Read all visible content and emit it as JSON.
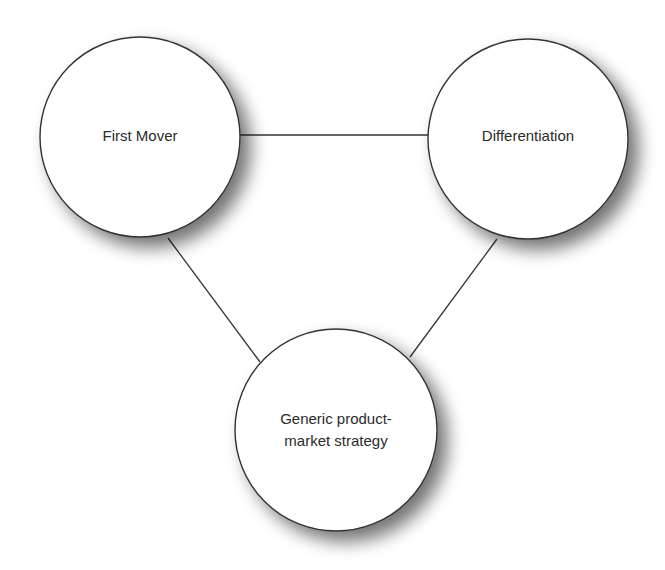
{
  "diagram": {
    "type": "triangle-relationship",
    "nodes": [
      {
        "id": "first-mover",
        "label_lines": [
          "First Mover"
        ],
        "cx": 140,
        "cy": 137,
        "r": 100
      },
      {
        "id": "differentiation",
        "label_lines": [
          "Differentiation"
        ],
        "cx": 528,
        "cy": 139,
        "r": 100
      },
      {
        "id": "generic-strategy",
        "label_lines": [
          "Generic product-",
          "market strategy"
        ],
        "cx": 336,
        "cy": 430,
        "r": 101
      }
    ],
    "edges": [
      {
        "from": "first-mover",
        "to": "differentiation"
      },
      {
        "from": "first-mover",
        "to": "generic-strategy"
      },
      {
        "from": "differentiation",
        "to": "generic-strategy"
      }
    ],
    "colors": {
      "stroke": "#333333",
      "fill": "#ffffff",
      "text": "#2b2b2b",
      "shadow": "#8a8a8a"
    }
  }
}
